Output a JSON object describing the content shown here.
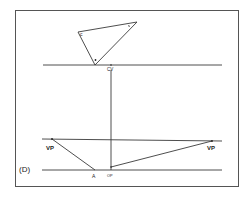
{
  "figure": {
    "panel_label": "(D)",
    "colors": {
      "line": "#3a3a3a",
      "frame": "#555555",
      "background": "#ffffff"
    },
    "triangle": {
      "vertices": [
        [
          78,
          32
        ],
        [
          137,
          22
        ],
        [
          95,
          65
        ]
      ],
      "vertex_label": "c"
    },
    "horizon_line": {
      "y": 65,
      "x1": 43,
      "x2": 222,
      "label": "CV"
    },
    "vanishing_line": {
      "y1": 139,
      "y2": 141,
      "x1": 42,
      "x2": 222
    },
    "ground_line": {
      "y": 170,
      "x1": 42,
      "x2": 222
    },
    "vertical_line": {
      "x": 111,
      "y1": 65,
      "y2": 170
    },
    "vp_left": {
      "x": 52,
      "y": 139,
      "label": "VP"
    },
    "vp_right": {
      "x": 212,
      "y": 141,
      "label": "VP"
    },
    "point_a": {
      "x": 95,
      "y": 170,
      "label": "A"
    },
    "point_op": {
      "x": 111,
      "y": 168,
      "label": "OP"
    }
  }
}
